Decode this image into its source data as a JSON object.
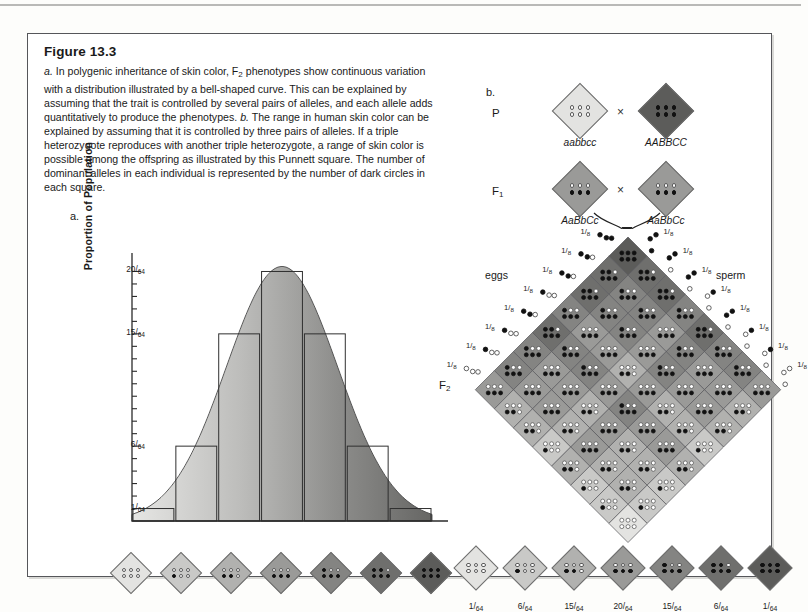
{
  "figure": {
    "title": "Figure 13.3",
    "caption_parts": [
      {
        "style": "italic",
        "text": "a."
      },
      {
        "style": "normal",
        "text": " In polygenic inheritance of skin color, F"
      },
      {
        "style": "sub",
        "text": "2"
      },
      {
        "style": "normal",
        "text": " phenotypes show continuous variation with a distribution illustrated by a bell-shaped curve. This can be explained by assuming that the trait is controlled by several pairs of alleles, and each allele adds quantitatively to produce the phenotypes. "
      },
      {
        "style": "italic",
        "text": "b."
      },
      {
        "style": "normal",
        "text": " The range in human skin color can be explained by assuming that it is controlled by three pairs of alleles. If a triple heterozygote reproduces with another triple heterozygote, a range of skin color is possible among the offspring as illustrated by this Punnett square. The number of dominant alleles in each individual is represented by the number of dark circles in each square."
      }
    ],
    "panel_a_letter": "a.",
    "panel_b_letter": "b."
  },
  "chart_data": {
    "type": "bar",
    "title": "",
    "xlabel": "",
    "ylabel": "Proportion of Population",
    "categories": [
      "0 dark alleles",
      "1 dark allele",
      "2 dark alleles",
      "3 dark alleles",
      "4 dark alleles",
      "5 dark alleles",
      "6 dark alleles"
    ],
    "values": [
      1,
      6,
      15,
      20,
      15,
      6,
      1
    ],
    "value_labels": [
      "1/64",
      "6/64",
      "15/64",
      "20/64",
      "15/64",
      "6/64",
      "1/64"
    ],
    "denominator": 64,
    "ylim": [
      0,
      21
    ],
    "grid": false,
    "legend": false,
    "overlay_curve": "bell-shaped normal distribution",
    "y_ticks": [
      {
        "num": "20",
        "den": "64",
        "value": 20
      },
      {
        "num": "15",
        "den": "64",
        "value": 15
      },
      {
        "num": "6",
        "den": "64",
        "value": 6
      },
      {
        "num": "1",
        "den": "64",
        "value": 1
      }
    ],
    "minor_tick_count": 20
  },
  "phenotype_strip_a": {
    "items": [
      {
        "dark": 0,
        "shade": "#e3e3e1"
      },
      {
        "dark": 1,
        "shade": "#c9c9c7"
      },
      {
        "dark": 2,
        "shade": "#b1b1af"
      },
      {
        "dark": 3,
        "shade": "#9a9a98"
      },
      {
        "dark": 4,
        "shade": "#848482"
      },
      {
        "dark": 5,
        "shade": "#6f6f6d"
      },
      {
        "dark": 6,
        "shade": "#5c5c5a"
      }
    ]
  },
  "phenotype_strip_b": {
    "items": [
      {
        "dark": 0,
        "shade": "#e3e3e1",
        "ratio_num": "1",
        "ratio_den": "64"
      },
      {
        "dark": 1,
        "shade": "#c9c9c7",
        "ratio_num": "6",
        "ratio_den": "64"
      },
      {
        "dark": 2,
        "shade": "#b1b1af",
        "ratio_num": "15",
        "ratio_den": "64"
      },
      {
        "dark": 3,
        "shade": "#9a9a98",
        "ratio_num": "20",
        "ratio_den": "64"
      },
      {
        "dark": 4,
        "shade": "#848482",
        "ratio_num": "15",
        "ratio_den": "64"
      },
      {
        "dark": 5,
        "shade": "#6f6f6d",
        "ratio_num": "6",
        "ratio_den": "64"
      },
      {
        "dark": 6,
        "shade": "#5c5c5a",
        "ratio_num": "1",
        "ratio_den": "64"
      }
    ]
  },
  "crosses": {
    "p": {
      "label": "P",
      "left": {
        "genotype": "aabbcc",
        "dark": 0,
        "shade": "#e3e3e1"
      },
      "right": {
        "genotype": "AABBCC",
        "dark": 6,
        "shade": "#5c5c5a"
      },
      "operator": "×"
    },
    "f1": {
      "label": "F",
      "sub": "1",
      "left": {
        "genotype": "AaBbCc",
        "dark": 3,
        "shade": "#9a9a98"
      },
      "right": {
        "genotype": "AaBbCc",
        "dark": 3,
        "shade": "#9a9a98"
      },
      "operator": "×"
    }
  },
  "punnett": {
    "f2_label": "F",
    "f2_sub": "2",
    "eggs_label": "eggs",
    "sperm_label": "sperm",
    "gamete_fraction_num": "1",
    "gamete_fraction_den": "8",
    "grid_size": 8,
    "gametes": [
      "ABC",
      "ABc",
      "AbC",
      "Abc",
      "aBC",
      "aBc",
      "abC",
      "abc"
    ],
    "gamete_dark_counts": [
      3,
      2,
      2,
      1,
      2,
      1,
      1,
      0
    ],
    "square_cell_count": 64
  },
  "colors": {
    "page_background": "#fdfdfb",
    "box_border": "#55565a",
    "text": "#1a1a1a",
    "curve_light": "#dedede",
    "curve_dark": "#6b6b6b",
    "diamond_outline": "#6d6d6d",
    "dot_dark": "#111111",
    "dot_light": "#ffffff"
  }
}
